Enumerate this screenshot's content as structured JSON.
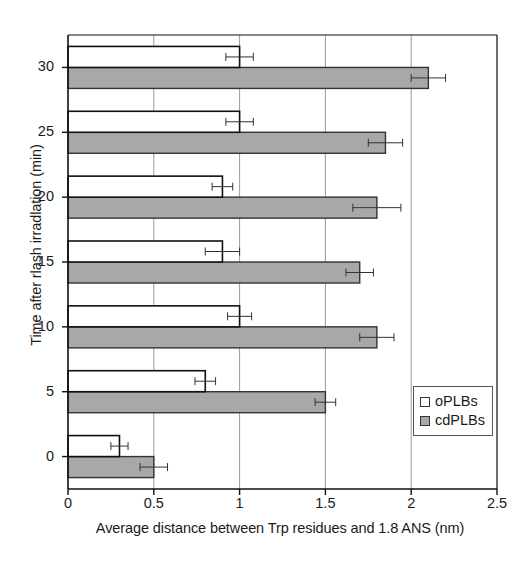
{
  "chart_data": {
    "type": "bar",
    "orientation": "horizontal",
    "title": "",
    "xlabel": "Average distance between Trp residues and 1.8 ANS (nm)",
    "ylabel": "Time after rlash irradlation (min)",
    "categories": [
      "0",
      "5",
      "10",
      "15",
      "20",
      "25",
      "30"
    ],
    "category_values": [
      0,
      5,
      10,
      15,
      20,
      25,
      30
    ],
    "xlim": [
      0,
      2.5
    ],
    "ylim": [
      -2.5,
      32.5
    ],
    "xticks": [
      "0",
      "0.5",
      "1",
      "1.5",
      "2",
      "2.5"
    ],
    "xtick_values": [
      0,
      0.5,
      1,
      1.5,
      2,
      2.5
    ],
    "yticks": [
      "0",
      "5",
      "10",
      "15",
      "20",
      "25",
      "30"
    ],
    "grid": "vertical",
    "legend_position": "inside-lower-right",
    "series": [
      {
        "name": "oPLBs",
        "color": "#ffffff",
        "edge_color": "#111111",
        "values": [
          0.3,
          0.8,
          1.0,
          0.9,
          0.9,
          1.0,
          1.0
        ],
        "errors": [
          0.05,
          0.06,
          0.07,
          0.1,
          0.06,
          0.08,
          0.08
        ]
      },
      {
        "name": "cdPLBs",
        "color": "#a8a8a8",
        "edge_color": "#333333",
        "values": [
          0.5,
          1.5,
          1.8,
          1.7,
          1.8,
          1.85,
          2.1
        ],
        "errors": [
          0.08,
          0.06,
          0.1,
          0.08,
          0.14,
          0.1,
          0.1
        ]
      }
    ]
  },
  "legend": {
    "items": [
      {
        "label": "oPLBs",
        "swatch_class": "series-oplbs"
      },
      {
        "label": "cdPLBs",
        "swatch_class": "series-cdplbs"
      }
    ]
  },
  "colors": {
    "axis": "#111111",
    "grid": "#9a9a9a",
    "oplbs_fill": "#ffffff",
    "cdplbs_fill": "#a8a8a8",
    "text": "#1a1a1a"
  }
}
